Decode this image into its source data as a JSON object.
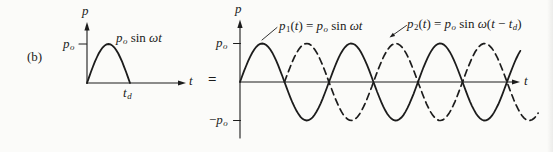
{
  "panel_label": "(b)",
  "equals_sign": "=",
  "ink_color": "#1c1c1c",
  "left_chart": {
    "y_axis_label": "p",
    "x_axis_label": "t",
    "y_tick_label": [
      {
        "t": "p"
      },
      {
        "t": "o",
        "sub": true
      }
    ],
    "x_tick_label": [
      {
        "t": "t"
      },
      {
        "t": "d",
        "sub": true
      }
    ],
    "curve_label": [
      {
        "t": "p"
      },
      {
        "t": "o",
        "sub": true
      },
      {
        "t": " sin ",
        "rm": true
      },
      {
        "t": "ω"
      },
      {
        "t": "t"
      }
    ]
  },
  "right_chart": {
    "y_axis_label": "p",
    "x_axis_label": "t",
    "y_tick_top_label": [
      {
        "t": "p"
      },
      {
        "t": "o",
        "sub": true
      }
    ],
    "y_tick_bottom_label": [
      {
        "t": "−",
        "rm": true
      },
      {
        "t": "p"
      },
      {
        "t": "o",
        "sub": true
      }
    ],
    "p1_label": [
      {
        "t": "p"
      },
      {
        "t": "1",
        "sub": true,
        "rm": true
      },
      {
        "t": "(",
        "rm": true
      },
      {
        "t": "t"
      },
      {
        "t": ") = ",
        "rm": true
      },
      {
        "t": "p"
      },
      {
        "t": "o",
        "sub": true
      },
      {
        "t": " sin ",
        "rm": true
      },
      {
        "t": "ω"
      },
      {
        "t": "t"
      }
    ],
    "p2_label": [
      {
        "t": "p"
      },
      {
        "t": "2",
        "sub": true,
        "rm": true
      },
      {
        "t": "(",
        "rm": true
      },
      {
        "t": "t"
      },
      {
        "t": ") = ",
        "rm": true
      },
      {
        "t": "p"
      },
      {
        "t": "o",
        "sub": true
      },
      {
        "t": " sin ",
        "rm": true
      },
      {
        "t": "ω"
      },
      {
        "t": "(",
        "rm": true
      },
      {
        "t": "t"
      },
      {
        "t": " − ",
        "rm": true
      },
      {
        "t": "t"
      },
      {
        "t": "d",
        "sub": true
      },
      {
        "t": ")",
        "rm": true
      }
    ]
  },
  "chart_data": [
    {
      "type": "line",
      "panel": "left",
      "title": "Half-sine pulse of duration t_d",
      "xlabel": "t",
      "ylabel": "p",
      "x_unit": "multiples of t_d (pulse duration)",
      "y_unit": "multiples of p_o",
      "xticks": [
        {
          "value": 1,
          "label": "t_d"
        }
      ],
      "yticks": [
        {
          "value": 1,
          "label": "p_o"
        }
      ],
      "ylim": [
        0,
        1
      ],
      "grid": false,
      "series": [
        {
          "name": "p_o sin ωt",
          "line_style": "solid",
          "phase_shift_td": 0,
          "x": [
            0,
            0.25,
            0.5,
            0.75,
            1
          ],
          "y": [
            0,
            0.707,
            1,
            0.707,
            0
          ],
          "note": "p = 0 for t > t_d; curve follows the t-axis after t_d"
        }
      ]
    },
    {
      "type": "line",
      "panel": "right",
      "title": "Decomposition into two sinusoids (equal to the pulse when summed)",
      "xlabel": "t",
      "ylabel": "p",
      "x_unit": "multiples of t_d (= half period π/ω)",
      "y_unit": "multiples of p_o",
      "yticks": [
        {
          "value": 1,
          "label": "p_o"
        },
        {
          "value": -1,
          "label": "−p_o"
        }
      ],
      "ylim": [
        -1,
        1
      ],
      "grid": false,
      "legend_position": "annotations with leader lines",
      "series": [
        {
          "name": "p1(t) = p_o sin ωt",
          "line_style": "solid",
          "phase_shift_td": 0,
          "x": [
            0,
            0.5,
            1,
            1.5,
            2,
            2.5,
            3,
            3.5,
            4,
            4.5,
            5,
            5.5,
            6,
            6.3
          ],
          "y": [
            0,
            1,
            0,
            -1,
            0,
            1,
            0,
            -1,
            0,
            1,
            0,
            -1,
            0,
            0.81
          ]
        },
        {
          "name": "p2(t) = p_o sin ω(t − t_d)",
          "line_style": "dashed",
          "phase_shift_td": 1,
          "x": [
            1,
            1.5,
            2,
            2.5,
            3,
            3.5,
            4,
            4.5,
            5,
            5.5,
            6,
            6.5,
            6.7
          ],
          "y": [
            0,
            1,
            0,
            -1,
            0,
            1,
            0,
            -1,
            0,
            1,
            0,
            -1,
            -0.81
          ]
        }
      ]
    }
  ]
}
